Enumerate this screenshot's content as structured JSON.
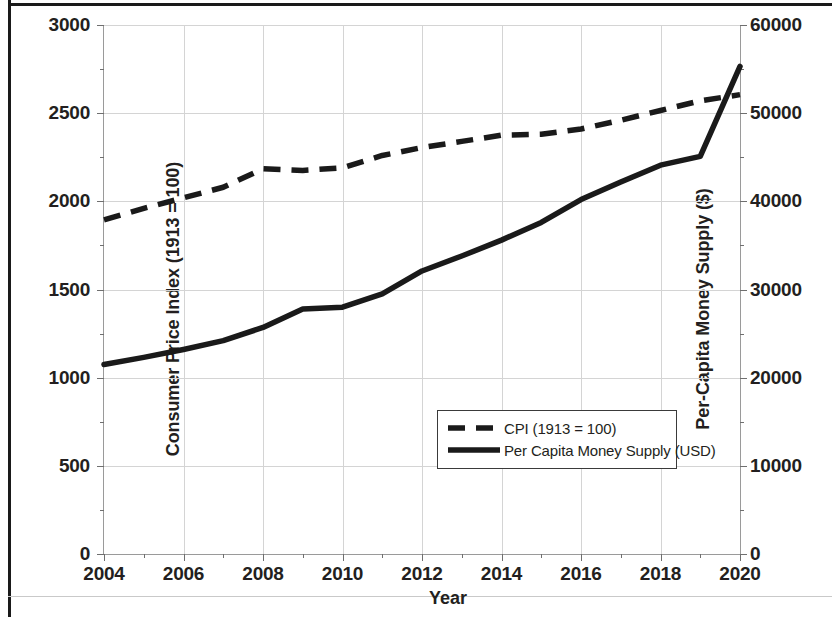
{
  "chart_data": {
    "type": "line",
    "title": "",
    "xlabel": "Year",
    "ylabel": "Consumer Price Index (1913 = 100)",
    "y2label": "Per-Capita Money Supply ($)",
    "xlim": [
      2004,
      2020
    ],
    "ylim": [
      0,
      3000
    ],
    "y2lim": [
      0,
      60000
    ],
    "grid": true,
    "legend_position": "center-right-inside",
    "x": [
      2004,
      2005,
      2006,
      2007,
      2008,
      2009,
      2010,
      2011,
      2012,
      2013,
      2014,
      2015,
      2016,
      2017,
      2018,
      2019,
      2020
    ],
    "xticks": [
      2004,
      2006,
      2008,
      2010,
      2012,
      2014,
      2016,
      2018,
      2020
    ],
    "xticklabels": [
      "2004",
      "2006",
      "2008",
      "2010",
      "2012",
      "2014",
      "2016",
      "2018",
      "2020"
    ],
    "yticks": [
      0,
      500,
      1000,
      1500,
      2000,
      2500,
      3000
    ],
    "yticklabels": [
      "0",
      "500",
      "1000",
      "1500",
      "2000",
      "2500",
      "3000"
    ],
    "y2ticks": [
      0,
      10000,
      20000,
      30000,
      40000,
      50000,
      60000
    ],
    "y2ticklabels": [
      "0",
      "10000",
      "20000",
      "30000",
      "40000",
      "50000",
      "60000"
    ],
    "series": [
      {
        "name": "CPI (1913 = 100)",
        "axis": "left",
        "style": "dashed",
        "color": "#1a1a1a",
        "values": [
          1895,
          1960,
          2020,
          2080,
          2185,
          2175,
          2190,
          2260,
          2305,
          2340,
          2375,
          2380,
          2410,
          2460,
          2515,
          2570,
          2605
        ]
      },
      {
        "name": "Per Capita Money Supply (USD)",
        "axis": "right",
        "style": "solid",
        "color": "#1a1a1a",
        "values": [
          21500,
          22300,
          23200,
          24200,
          25700,
          27800,
          28000,
          29500,
          32100,
          33800,
          35600,
          37600,
          40200,
          42200,
          44100,
          45100,
          55300
        ]
      }
    ]
  },
  "axes": {
    "left_title": "Consumer Price Index (1913 = 100)",
    "right_title": "Per-Capita Money Supply ($)",
    "x_title": "Year"
  },
  "legend": {
    "entries": [
      {
        "label": "CPI (1913 = 100)",
        "style": "dashed"
      },
      {
        "label": "Per Capita Money Supply (USD)",
        "style": "solid"
      }
    ]
  }
}
